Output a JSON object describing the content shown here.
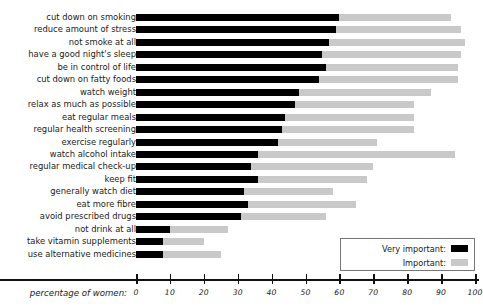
{
  "axis": {
    "title": "percentage of women:",
    "ticks": [
      0,
      10,
      20,
      30,
      40,
      50,
      60,
      70,
      80,
      90,
      100
    ],
    "min": 0,
    "max": 100
  },
  "legend": {
    "very_important_label": "Very important:",
    "important_label": "Important:",
    "very_important_color": "#000000",
    "important_color": "#c9c9c9"
  },
  "chart_data": {
    "type": "bar",
    "orientation": "horizontal",
    "stacked": true,
    "title": "",
    "subtitle": "",
    "xlabel": "percentage of women:",
    "ylabel": "",
    "xlim": [
      0,
      100
    ],
    "grid": false,
    "legend_position": "bottom-right",
    "categories": [
      "cut down on smoking",
      "reduce amount of stress",
      "not smoke at all",
      "have a good night's sleep",
      "be in control of life",
      "cut down on fatty foods",
      "watch weight",
      "relax as much as possible",
      "eat regular meals",
      "regular health screening",
      "exercise regularly",
      "watch alcohol intake",
      "regular medical check-up",
      "keep fit",
      "generally watch diet",
      "eat more fibre",
      "avoid prescribed drugs",
      "not drink at all",
      "take vitamin supplements",
      "use alternative medicines"
    ],
    "series": [
      {
        "name": "Very important:",
        "color": "#000000",
        "values": [
          60,
          59,
          57,
          55,
          56,
          54,
          48,
          47,
          44,
          43,
          42,
          36,
          34,
          36,
          32,
          33,
          31,
          10,
          8,
          8
        ]
      },
      {
        "name": "Important:",
        "color": "#c9c9c9",
        "values": [
          33,
          37,
          40,
          41,
          39,
          41,
          39,
          35,
          38,
          39,
          29,
          58,
          36,
          32,
          26,
          32,
          25,
          17,
          12,
          17
        ]
      }
    ],
    "totals": [
      93,
      96,
      97,
      96,
      95,
      95,
      87,
      82,
      82,
      82,
      71,
      94,
      70,
      68,
      58,
      65,
      56,
      27,
      20,
      25
    ]
  },
  "rows": [
    {
      "label": "cut down on smoking",
      "very": 60,
      "imp": 33
    },
    {
      "label": "reduce amount of stress",
      "very": 59,
      "imp": 37
    },
    {
      "label": "not smoke at all",
      "very": 57,
      "imp": 40
    },
    {
      "label": "have a good night's sleep",
      "very": 55,
      "imp": 41
    },
    {
      "label": "be in control of life",
      "very": 56,
      "imp": 39
    },
    {
      "label": "cut down on fatty foods",
      "very": 54,
      "imp": 41
    },
    {
      "label": "watch weight",
      "very": 48,
      "imp": 39
    },
    {
      "label": "relax as much as possible",
      "very": 47,
      "imp": 35
    },
    {
      "label": "eat regular meals",
      "very": 44,
      "imp": 38
    },
    {
      "label": "regular health screening",
      "very": 43,
      "imp": 39
    },
    {
      "label": "exercise regularly",
      "very": 42,
      "imp": 29
    },
    {
      "label": "watch alcohol intake",
      "very": 36,
      "imp": 58
    },
    {
      "label": "regular medical check-up",
      "very": 34,
      "imp": 36
    },
    {
      "label": "keep fit",
      "very": 36,
      "imp": 32
    },
    {
      "label": "generally watch diet",
      "very": 32,
      "imp": 26
    },
    {
      "label": "eat more fibre",
      "very": 33,
      "imp": 32
    },
    {
      "label": "avoid prescribed drugs",
      "very": 31,
      "imp": 25
    },
    {
      "label": "not drink at all",
      "very": 10,
      "imp": 17
    },
    {
      "label": "take vitamin supplements",
      "very": 8,
      "imp": 12
    },
    {
      "label": "use alternative medicines",
      "very": 8,
      "imp": 17
    }
  ]
}
